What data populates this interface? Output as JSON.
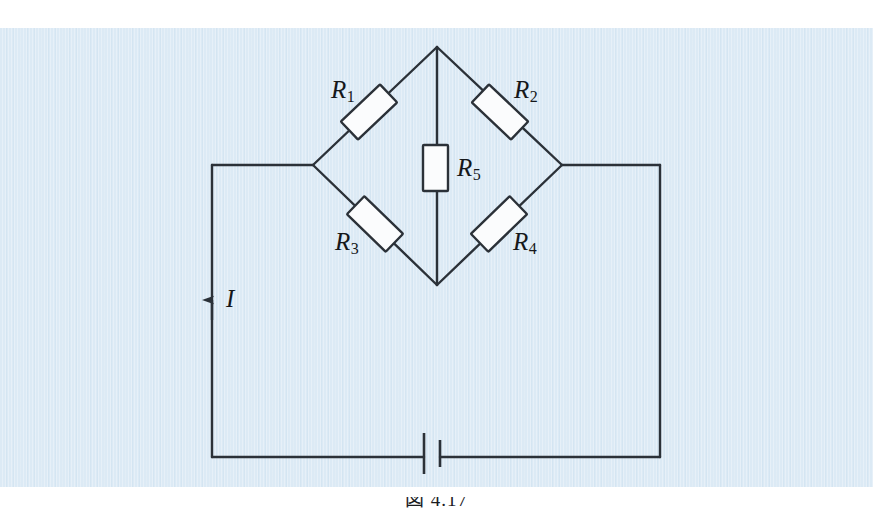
{
  "figure": {
    "kind": "circuit-diagram",
    "caption": "図 4.17",
    "background_color": "#dceaf5",
    "page_color": "#ffffff",
    "line_color": "#2b3138",
    "component_fill": "#fbfcfd"
  },
  "components": {
    "resistors": [
      {
        "id": "R1",
        "name": "R",
        "subscript": "1",
        "label": "R₁",
        "orientation": "diagonal-down-right",
        "arm": "upper-left"
      },
      {
        "id": "R2",
        "name": "R",
        "subscript": "2",
        "label": "R₂",
        "orientation": "diagonal-down-left",
        "arm": "upper-right"
      },
      {
        "id": "R3",
        "name": "R",
        "subscript": "3",
        "label": "R₃",
        "orientation": "diagonal-down-left",
        "arm": "lower-left"
      },
      {
        "id": "R4",
        "name": "R",
        "subscript": "4",
        "label": "R₄",
        "orientation": "diagonal-down-right",
        "arm": "lower-right"
      },
      {
        "id": "R5",
        "name": "R",
        "subscript": "5",
        "label": "R₅",
        "orientation": "vertical",
        "arm": "bridge"
      }
    ],
    "battery": {
      "id": "battery",
      "label": "",
      "type": "cell",
      "position": "bottom-center"
    },
    "current": {
      "id": "current-I",
      "name": "I",
      "label": "I",
      "direction": "upward",
      "position": "left-branch"
    }
  },
  "nodes": {
    "top_apex": {
      "x": 437,
      "y": 47
    },
    "left_node": {
      "x": 313,
      "y": 165
    },
    "right_node": {
      "x": 562,
      "y": 165
    },
    "bottom_apex": {
      "x": 437,
      "y": 285
    },
    "left_corner": {
      "x": 212,
      "y": 165
    },
    "right_corner": {
      "x": 660,
      "y": 165
    },
    "bottom_left_corner": {
      "x": 212,
      "y": 457
    },
    "bottom_right_corner": {
      "x": 660,
      "y": 457
    }
  }
}
